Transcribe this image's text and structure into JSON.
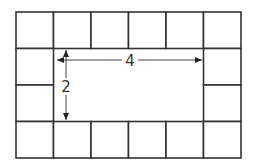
{
  "diagram": {
    "grid": {
      "cols": 6,
      "rows": 4
    },
    "interior": {
      "width": 4,
      "height": 2
    },
    "labels": {
      "width": "4",
      "height": "2"
    },
    "colors": {
      "line": "#333333",
      "background": "#ffffff"
    }
  }
}
